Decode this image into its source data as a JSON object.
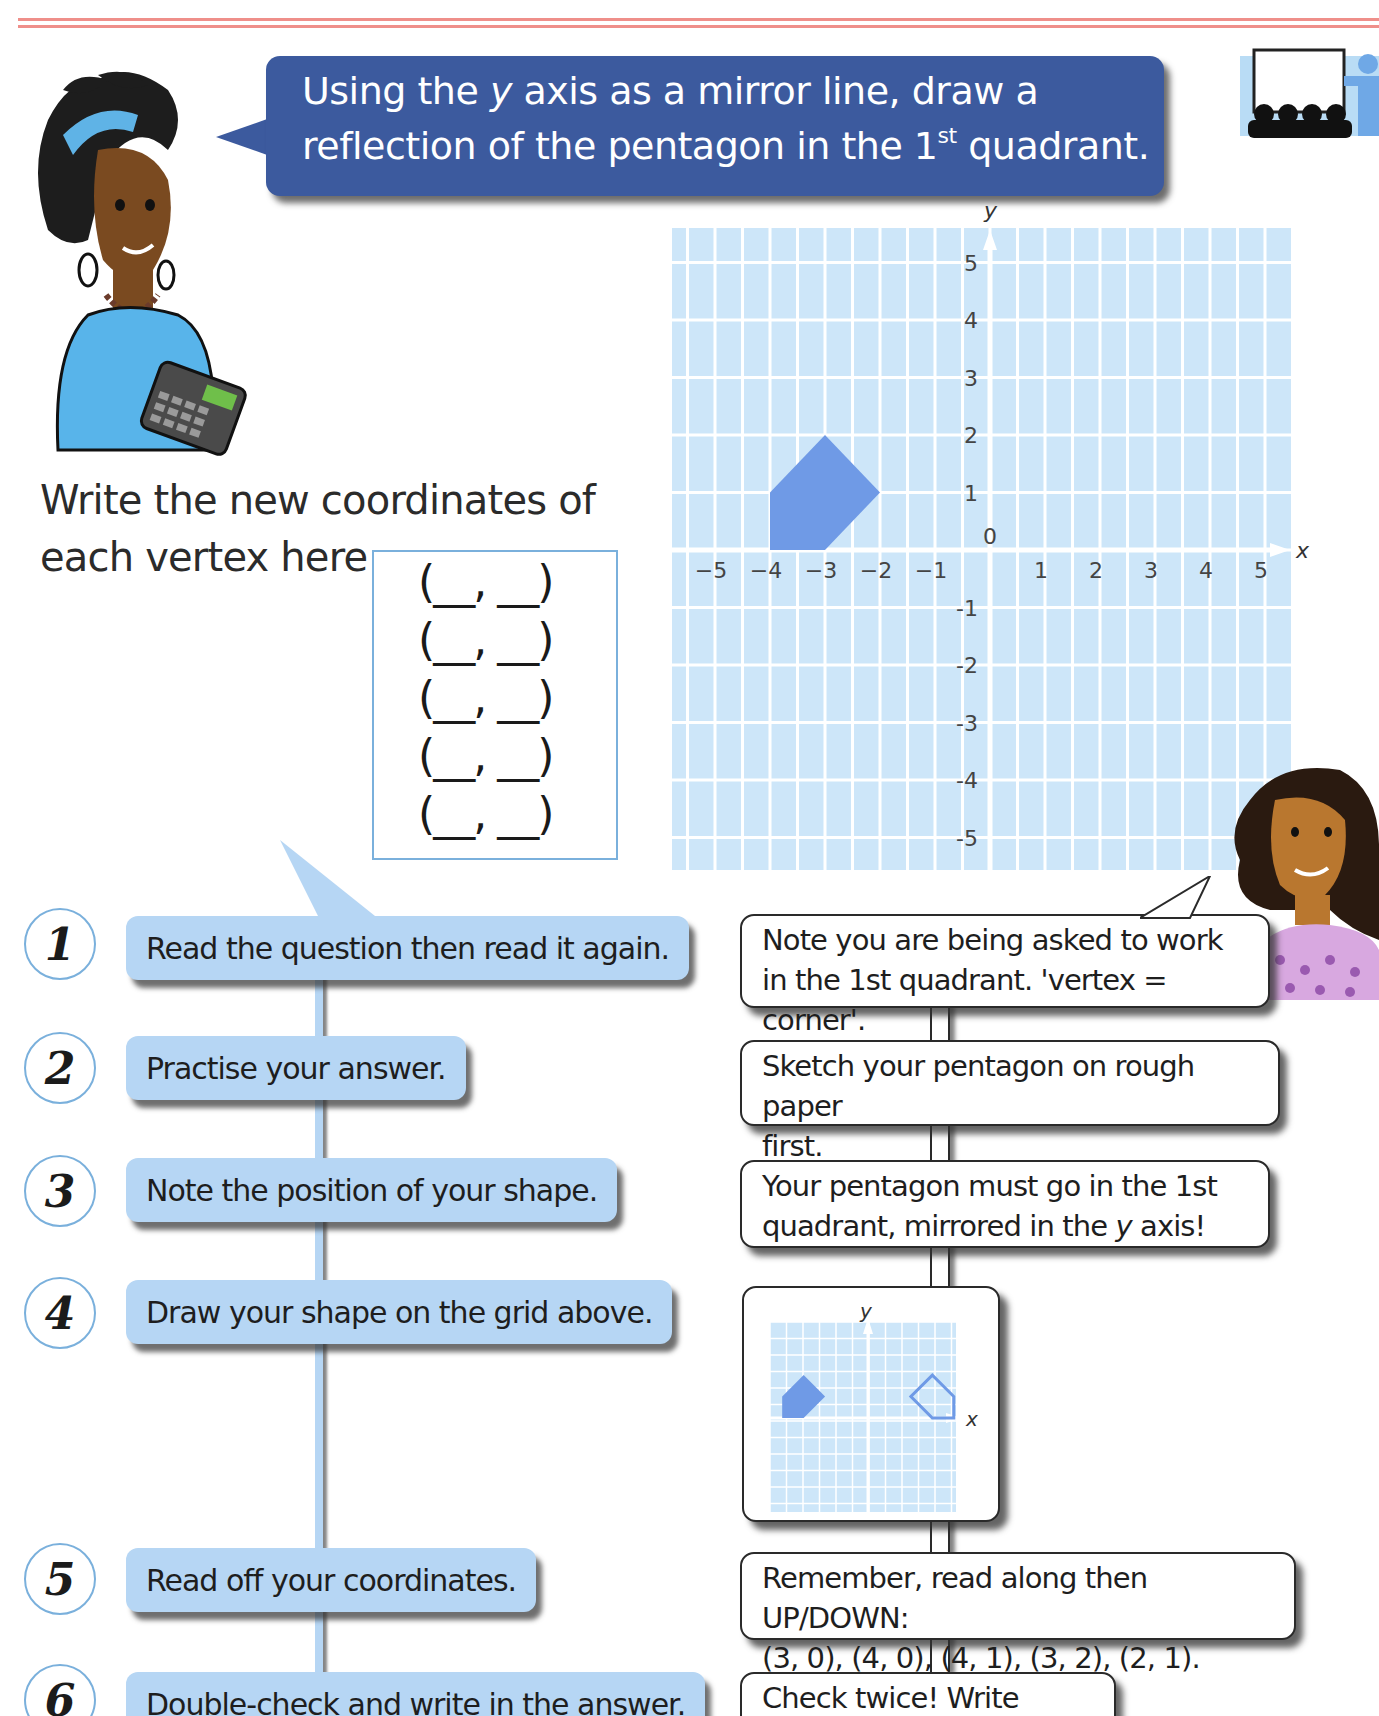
{
  "page": {
    "title_bubble": {
      "line1_pre": "Using the ",
      "line1_var": "y",
      "line1_post": " axis as a mirror line, draw a",
      "line2_pre": "reflection of the pentagon in the 1",
      "line2_sup": "st",
      "line2_post": " quadrant."
    },
    "prompt": {
      "line1": "Write the new coordinates of",
      "line2": "each vertex here"
    },
    "answer_rows": [
      "(__, __)",
      "(__, __)",
      "(__, __)",
      "(__, __)",
      "(__, __)"
    ],
    "icons": {
      "presentation": "presentation-icon",
      "teacher": "teacher-with-calculator-illustration",
      "student": "student-illustration"
    },
    "colors": {
      "title_bg": "#3c5a9e",
      "grid_bg": "#cde6f9",
      "grid_line": "#ffffff",
      "shape_fill": "#6f9ae6",
      "step_bg": "#b6d6f4",
      "circle_border": "#7ab0dc",
      "top_rule": "#ef8f8a"
    }
  },
  "steps": [
    {
      "number": "1",
      "text": "Read the question then read it again."
    },
    {
      "number": "2",
      "text": "Practise your answer."
    },
    {
      "number": "3",
      "text": "Note the position of your shape."
    },
    {
      "number": "4",
      "text": "Draw your shape on the grid above."
    },
    {
      "number": "5",
      "text": "Read off your coordinates."
    },
    {
      "number": "6",
      "text": "Double-check and write in the answer."
    }
  ],
  "tips": [
    {
      "line1": "Note you are being asked to work",
      "line2": "in the 1st quadrant. 'vertex = corner'."
    },
    {
      "line1": "Sketch your pentagon on rough paper",
      "line2": "first."
    },
    {
      "line1_pre": "Your pentagon must go in the 1st",
      "line2_pre": "quadrant, mirrored in the ",
      "line2_var": "y",
      "line2_post": " axis!"
    },
    {
      "mini_x_label": "x",
      "mini_y_label": "y"
    },
    {
      "line1": "Remember, read along then UP/DOWN:",
      "line2": "(3, 0), (4, 0), (4, 1), (3, 2), (2, 1)."
    },
    {
      "line1": "Check twice! Write once!"
    }
  ],
  "chart_data": {
    "type": "scatter",
    "xlabel": "x",
    "ylabel": "y",
    "xlim": [
      -5,
      5
    ],
    "ylim": [
      -5,
      5
    ],
    "grid": true,
    "x_ticks": [
      "-5",
      "-4",
      "-3",
      "-2",
      "-1",
      "0",
      "1",
      "2",
      "3",
      "4",
      "5"
    ],
    "y_ticks": [
      "5",
      "4",
      "3",
      "2",
      "1",
      "-1",
      "-2",
      "-3",
      "-4",
      "-5"
    ],
    "series": [
      {
        "name": "pentagon",
        "shape": "filled-polygon",
        "points": [
          [
            -4,
            0
          ],
          [
            -3,
            0
          ],
          [
            -2,
            1
          ],
          [
            -3,
            2
          ],
          [
            -4,
            1
          ]
        ]
      }
    ]
  }
}
